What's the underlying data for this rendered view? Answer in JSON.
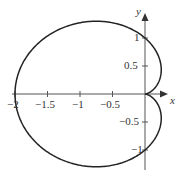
{
  "chart_data": {
    "type": "line",
    "title": "",
    "curve": "cardioid r = 1 - cos(theta)",
    "xlabel": "x",
    "ylabel": "y",
    "xlim": [
      -2,
      0.2
    ],
    "ylim": [
      -1.3,
      1.35
    ],
    "x_ticks": [
      "-2",
      "-1.5",
      "-1",
      "-0.5"
    ],
    "y_ticks": [
      "1",
      "0.5",
      "-0.5",
      "-1"
    ],
    "grid": false,
    "series": [
      {
        "name": "cardioid",
        "color": "#222222"
      }
    ]
  },
  "labels": {
    "x_axis": "x",
    "y_axis": "y",
    "xt0": "−2",
    "xt1": "−1.5",
    "xt2": "−1",
    "xt3": "−0.5",
    "yt0": "1",
    "yt1": "0.5",
    "yt2": "−0.5",
    "yt3": "−1"
  }
}
